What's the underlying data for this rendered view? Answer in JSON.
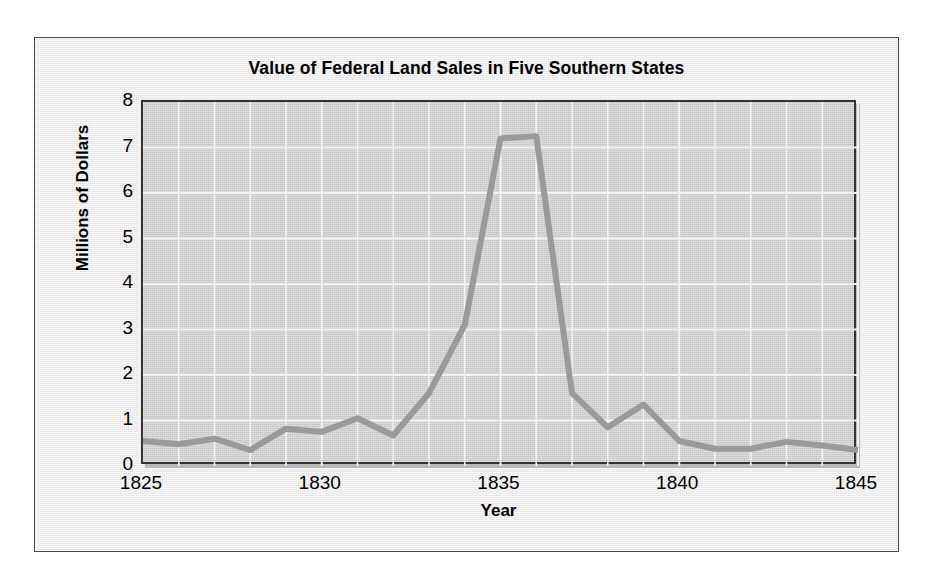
{
  "chart_data": {
    "type": "line",
    "title": "Value of Federal Land Sales in Five Southern States",
    "xlabel": "Year",
    "ylabel": "Millions of Dollars",
    "xlim": [
      1825,
      1845
    ],
    "ylim": [
      0,
      8
    ],
    "x_ticks": [
      1825,
      1830,
      1835,
      1840,
      1845
    ],
    "x_tick_labels": [
      "1825",
      "1830",
      "1835",
      "1840",
      "1845"
    ],
    "y_ticks": [
      0,
      1,
      2,
      3,
      4,
      5,
      6,
      7,
      8
    ],
    "y_tick_labels": [
      "0",
      "1",
      "2",
      "3",
      "4",
      "5",
      "6",
      "7",
      "8"
    ],
    "x_minor_step": 1,
    "y_minor_step": 1,
    "grid": true,
    "grid_color": "#f2f2f2",
    "legend": false,
    "line_color": "#9a9a9a",
    "line_width": 6,
    "plot_background": "#cfcfcf",
    "figure_background": "#eaeaea",
    "x": [
      1825,
      1826,
      1827,
      1828,
      1829,
      1830,
      1831,
      1832,
      1833,
      1834,
      1835,
      1836,
      1837,
      1838,
      1839,
      1840,
      1841,
      1842,
      1843,
      1844,
      1845
    ],
    "series": [
      {
        "name": "Value of federal land sales",
        "values": [
          0.55,
          0.48,
          0.6,
          0.35,
          0.82,
          0.75,
          1.05,
          0.67,
          1.6,
          3.1,
          7.2,
          7.25,
          1.6,
          0.85,
          1.35,
          0.55,
          0.38,
          0.38,
          0.53,
          0.45,
          0.35
        ]
      }
    ]
  }
}
